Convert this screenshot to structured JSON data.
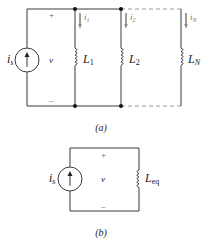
{
  "diagram_a": {
    "caption": "(a)",
    "source_label": "i",
    "source_sub": "s",
    "voltage_label": "v",
    "plus": "+",
    "minus": "–",
    "branches": [
      {
        "current": "i",
        "current_sub": "1",
        "inductor": "L",
        "inductor_sub": "1"
      },
      {
        "current": "i",
        "current_sub": "2",
        "inductor": "L",
        "inductor_sub": "2"
      },
      {
        "current": "i",
        "current_sub": "N",
        "inductor": "L",
        "inductor_sub": "N"
      }
    ]
  },
  "diagram_b": {
    "caption": "(b)",
    "source_label": "i",
    "source_sub": "s",
    "voltage_label": "v",
    "plus": "+",
    "minus": "–",
    "inductor": "L",
    "inductor_sub": "eq"
  },
  "colors": {
    "wire": "#3a3a3a",
    "dashed_wire": "#9a9a9a",
    "background": "#ffffff"
  }
}
